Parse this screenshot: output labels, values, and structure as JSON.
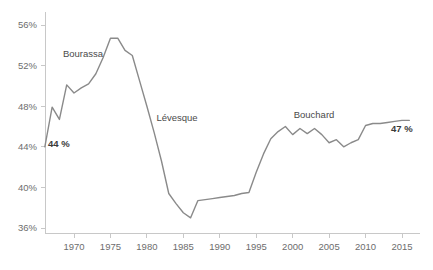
{
  "chart_data": {
    "type": "line",
    "title": "",
    "subtitle": "",
    "xlabel": "",
    "ylabel": "",
    "xlim": [
      1965,
      2017
    ],
    "ylim": [
      35,
      57
    ],
    "grid": false,
    "legend_position": "none",
    "y_tick_labels": [
      "56%",
      "52%",
      "48%",
      "44%",
      "40%",
      "36%"
    ],
    "y_tick_values": [
      56,
      52,
      48,
      44,
      40,
      36
    ],
    "x_tick_labels": [
      "1970",
      "1975",
      "1980",
      "1985",
      "1990",
      "1995",
      "2000",
      "2005",
      "2010",
      "2015"
    ],
    "x_tick_values": [
      1970,
      1975,
      1980,
      1985,
      1990,
      1995,
      2000,
      2005,
      2010,
      2015
    ],
    "line_color": "#8a8a8a",
    "series": [
      {
        "name": "share",
        "x": [
          1966,
          1967,
          1968,
          1969,
          1970,
          1971,
          1972,
          1973,
          1974,
          1975,
          1976,
          1977,
          1978,
          1979,
          1980,
          1981,
          1982,
          1983,
          1984,
          1985,
          1986,
          1987,
          1988,
          1989,
          1990,
          1991,
          1992,
          1993,
          1994,
          1995,
          1996,
          1997,
          1998,
          1999,
          2000,
          2001,
          2002,
          2003,
          2004,
          2005,
          2006,
          2007,
          2008,
          2009,
          2010,
          2011,
          2012,
          2013,
          2014,
          2015,
          2016
        ],
        "values": [
          44.0,
          47.9,
          46.7,
          50.1,
          49.3,
          49.8,
          50.2,
          51.2,
          52.8,
          54.7,
          54.7,
          53.5,
          53.0,
          50.5,
          48.0,
          45.4,
          42.6,
          39.4,
          38.4,
          37.5,
          37.0,
          38.7,
          38.8,
          38.9,
          39.0,
          39.1,
          39.2,
          39.4,
          39.5,
          41.5,
          43.3,
          44.8,
          45.5,
          46.0,
          45.2,
          45.8,
          45.3,
          45.8,
          45.2,
          44.4,
          44.7,
          44.0,
          44.4,
          44.7,
          46.1,
          46.3,
          46.3,
          46.4,
          46.5,
          46.6,
          46.6
        ]
      }
    ],
    "annotations": [
      {
        "name": "bourassa",
        "text": "Bourassa",
        "x_px": 83,
        "y_px": 57
      },
      {
        "name": "levesque",
        "text": "Lévesque",
        "x_px": 177,
        "y_px": 121
      },
      {
        "name": "bouchard",
        "text": "Bouchard",
        "x_px": 314,
        "y_px": 118
      },
      {
        "name": "start-value",
        "text": "44 %",
        "x_px": 48,
        "y_px": 147
      },
      {
        "name": "end-value",
        "text": "47 %",
        "x_px": 391,
        "y_px": 132
      }
    ]
  }
}
